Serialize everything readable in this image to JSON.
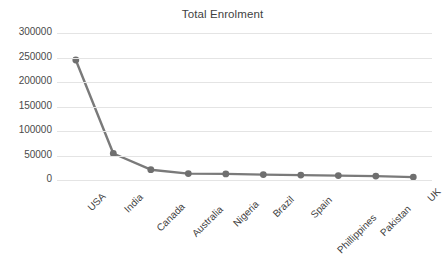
{
  "chart_data": {
    "type": "line",
    "title": "Total Enrolment",
    "xlabel": "",
    "ylabel": "",
    "categories": [
      "USA",
      "India",
      "Canada",
      "Australia",
      "Nigeria",
      "Brazil",
      "Spain",
      "Phillippines",
      "Pakistan",
      "UK"
    ],
    "values": [
      245000,
      54000,
      21000,
      13000,
      12500,
      11000,
      10000,
      9000,
      8000,
      6000
    ],
    "series": [
      {
        "name": "Total Enrolment",
        "values": [
          245000,
          54000,
          21000,
          13000,
          12500,
          11000,
          10000,
          9000,
          8000,
          6000
        ]
      }
    ],
    "ylim": [
      0,
      300000
    ],
    "ytick_labels": [
      "300000",
      "250000",
      "200000",
      "150000",
      "100000",
      "50000",
      "0"
    ],
    "ytick_values": [
      300000,
      250000,
      200000,
      150000,
      100000,
      50000,
      0
    ],
    "grid": true,
    "legend": false,
    "legend_position": "none",
    "line_color": "#7a7a7a",
    "marker_color": "#6f6f6f",
    "gridline_color": "#e4e4e4",
    "background_color": "#ffffff",
    "xlabel_rotation": -45
  }
}
